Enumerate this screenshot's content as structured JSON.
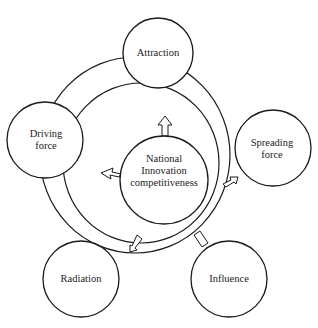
{
  "diagram": {
    "type": "concept-diagram",
    "center_node": {
      "label_lines": [
        "National",
        "Innovation",
        "competitiveness"
      ]
    },
    "nodes": [
      {
        "id": "attraction",
        "label_lines": [
          "Attraction"
        ]
      },
      {
        "id": "driving-force",
        "label_lines": [
          "Driving",
          "force"
        ]
      },
      {
        "id": "spreading-force",
        "label_lines": [
          "Spreading",
          "force"
        ]
      },
      {
        "id": "radiation",
        "label_lines": [
          "Radiation"
        ]
      },
      {
        "id": "influence",
        "label_lines": [
          "Influence"
        ]
      }
    ],
    "arrows": [
      {
        "from": "center",
        "to": "attraction",
        "direction": "up"
      },
      {
        "from": "center",
        "to": "driving-force",
        "direction": "left"
      },
      {
        "from": "ring",
        "to": "spreading-force",
        "direction": "up-right"
      },
      {
        "from": "ring",
        "to": "radiation",
        "direction": "down-left"
      },
      {
        "from": "ring",
        "to": "influence",
        "direction": "connector"
      }
    ],
    "colors": {
      "stroke": "#1a1a1a",
      "fill": "#ffffff",
      "text": "#222222"
    }
  }
}
